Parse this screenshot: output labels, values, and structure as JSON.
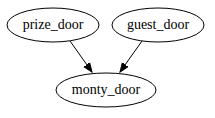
{
  "diagram": {
    "type": "directed-graph",
    "nodes": [
      {
        "id": "prize_door",
        "label": "prize_door",
        "cx": 53,
        "cy": 25,
        "rx": 46,
        "ry": 17
      },
      {
        "id": "guest_door",
        "label": "guest_door",
        "cx": 158,
        "cy": 25,
        "rx": 46,
        "ry": 17
      },
      {
        "id": "monty_door",
        "label": "monty_door",
        "cx": 106,
        "cy": 90,
        "rx": 50,
        "ry": 17
      }
    ],
    "edges": [
      {
        "from": "prize_door",
        "to": "monty_door"
      },
      {
        "from": "guest_door",
        "to": "monty_door"
      }
    ],
    "colors": {
      "stroke": "#000000",
      "fill": "#ffffff",
      "background": "#ffffff"
    }
  }
}
